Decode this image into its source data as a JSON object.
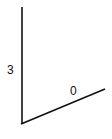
{
  "diagram": {
    "vertical_side_label": "3",
    "slanted_side_label": "0",
    "line_color": "#111111",
    "background": "#ffffff"
  }
}
